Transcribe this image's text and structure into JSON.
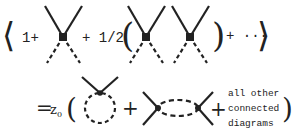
{
  "equation": {
    "top_row": {
      "open_bracket": "⟨",
      "term1": "1+",
      "plus_half": "+ 1/2",
      "open_paren": "(",
      "close_paren": ")",
      "plus_dots": "+ ···",
      "close_bracket": "⟩"
    },
    "bottom_row": {
      "equals": "=",
      "z": "z",
      "z_subscript": "0",
      "open_paren": "(",
      "plus1": "+",
      "plus2": "+",
      "other_line1": "all other",
      "other_line2": "connected",
      "other_line3": "diagrams",
      "close_paren": ")"
    }
  },
  "diagrams": [
    {
      "name": "single-vertex",
      "type": "four-point vertex with two external solid legs and two dashed legs"
    },
    {
      "name": "two-vertices",
      "type": "product of two four-point vertices"
    },
    {
      "name": "tadpole",
      "type": "vertex with dashed self-loop"
    },
    {
      "name": "bubble",
      "type": "two vertices joined by dashed loop"
    }
  ],
  "colors": {
    "ink": "#222222",
    "background": "#ffffff"
  }
}
